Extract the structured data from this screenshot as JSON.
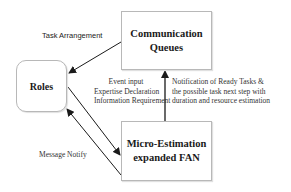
{
  "diagram": {
    "nodes": {
      "communication_queues": {
        "line1": "Communication",
        "line2": "Queues"
      },
      "roles": {
        "label": "Roles"
      },
      "micro_estimation": {
        "line1": "Micro-Estimation",
        "line2": "expanded FAN"
      }
    },
    "edges": {
      "task_arrangement": {
        "label": "Task Arrangement",
        "from": "Communication Queues",
        "to": "Roles"
      },
      "roles_to_fan": {
        "from": "Roles",
        "to": "Micro-Estimation expanded FAN",
        "lines": [
          "Event input",
          "Expertise Declaration",
          "Information Requirement"
        ]
      },
      "fan_to_queues": {
        "from": "Micro-Estimation expanded FAN",
        "to": "Communication Queues",
        "lines": [
          "Notification of Ready Tasks &",
          "the possible task next step with",
          "duration and resource estimation"
        ]
      },
      "message_notify": {
        "label": "Message Notify",
        "from": "Micro-Estimation expanded FAN",
        "to": "Roles"
      }
    },
    "colors": {
      "line": "#1a1a1a",
      "box_border": "#b8b8b8",
      "text": "#1a1a1a"
    }
  }
}
